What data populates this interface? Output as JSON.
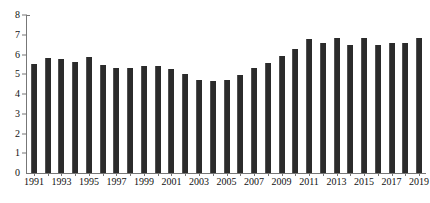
{
  "chart_data": {
    "type": "bar",
    "title": "",
    "subtitle": "",
    "xlabel": "",
    "ylabel": "",
    "ylim": [
      0,
      8
    ],
    "ytick_values": [
      0,
      1,
      2,
      3,
      4,
      5,
      6,
      7,
      8
    ],
    "ytick_labels": [
      "0",
      "1",
      "2",
      "3",
      "4",
      "5",
      "6",
      "7",
      "8"
    ],
    "grid": false,
    "legend": null,
    "legend_position": "none",
    "bar_color": "#2b2b2b",
    "axis_color": "#777777",
    "categories": [
      "1991",
      "1992",
      "1993",
      "1994",
      "1995",
      "1996",
      "1997",
      "1998",
      "1999",
      "2000",
      "2001",
      "2002",
      "2003",
      "2004",
      "2005",
      "2006",
      "2007",
      "2008",
      "2009",
      "2010",
      "2011",
      "2012",
      "2013",
      "2014",
      "2015",
      "2016",
      "2017",
      "2018",
      "2019"
    ],
    "xtick_labels": [
      "1991",
      "1993",
      "1995",
      "1997",
      "1999",
      "2001",
      "2003",
      "2005",
      "2007",
      "2009",
      "2011",
      "2013",
      "2015",
      "2017",
      "2019"
    ],
    "values": [
      5.5,
      5.8,
      5.75,
      5.6,
      5.85,
      5.45,
      5.3,
      5.3,
      5.4,
      5.4,
      5.25,
      5.0,
      4.7,
      4.65,
      4.7,
      4.95,
      5.3,
      5.55,
      5.95,
      6.3,
      6.8,
      6.6,
      6.85,
      6.5,
      6.85,
      6.5,
      6.6,
      6.6,
      6.85
    ]
  }
}
